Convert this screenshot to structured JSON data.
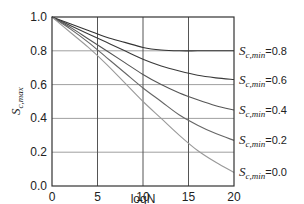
{
  "chart_data": {
    "type": "line",
    "title": "",
    "xlabel": "logN",
    "ylabel": "S_c,max",
    "xlim": [
      0,
      20
    ],
    "ylim": [
      0.0,
      1.0
    ],
    "xticks": [
      "0",
      "5",
      "10",
      "15",
      "20"
    ],
    "yticks": [
      "0.0",
      "0.2",
      "0.4",
      "0.6",
      "0.8",
      "1.0"
    ],
    "grid": true,
    "legend_position": "right (inline labels at curve ends)",
    "x": [
      0,
      2,
      4,
      6,
      8,
      10,
      12,
      14,
      16,
      18,
      20
    ],
    "series": [
      {
        "name": "S_c,min=0.8",
        "label_main": "S",
        "label_sub": "c,min",
        "label_val": "=0.8",
        "color": "#333333",
        "values": [
          1.0,
          0.96,
          0.92,
          0.88,
          0.85,
          0.82,
          0.805,
          0.8,
          0.8,
          0.8,
          0.8
        ]
      },
      {
        "name": "S_c,min=0.6",
        "label_main": "S",
        "label_sub": "c,min",
        "label_val": "=0.6",
        "color": "#3a3a3a",
        "values": [
          1.0,
          0.95,
          0.9,
          0.85,
          0.8,
          0.75,
          0.71,
          0.68,
          0.655,
          0.64,
          0.63
        ]
      },
      {
        "name": "S_c,min=0.4",
        "label_main": "S",
        "label_sub": "c,min",
        "label_val": "=0.4",
        "color": "#555555",
        "values": [
          1.0,
          0.94,
          0.87,
          0.8,
          0.73,
          0.66,
          0.6,
          0.55,
          0.51,
          0.475,
          0.45
        ]
      },
      {
        "name": "S_c,min=0.2",
        "label_main": "S",
        "label_sub": "c,min",
        "label_val": "=0.2",
        "color": "#666666",
        "values": [
          1.0,
          0.93,
          0.85,
          0.76,
          0.67,
          0.58,
          0.5,
          0.42,
          0.36,
          0.31,
          0.27
        ]
      },
      {
        "name": "S_c,min=0.0",
        "label_main": "S",
        "label_sub": "c,min",
        "label_val": "=0.0",
        "color": "#999999",
        "values": [
          1.0,
          0.91,
          0.82,
          0.72,
          0.61,
          0.5,
          0.4,
          0.3,
          0.21,
          0.14,
          0.08
        ]
      }
    ]
  }
}
